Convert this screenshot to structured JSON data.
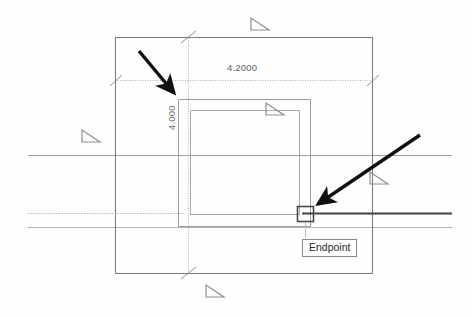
{
  "app": {
    "context": "cad-drawing-viewport",
    "background_color": "#fefefe"
  },
  "dimensions": {
    "horizontal": {
      "label": "4.2000",
      "name": "horizontal-dimension",
      "units": "inches"
    },
    "vertical": {
      "label": "4.000",
      "name": "vertical-dimension",
      "units": "inches"
    }
  },
  "tooltip": {
    "label": "Endpoint",
    "border_color": "#8a8a8a",
    "text_color": "#2b2b2b",
    "background_color": "#fdfdfd"
  },
  "snap_marker": {
    "name": "endpoint-snap-square",
    "type": "square",
    "color": "#4a4a4a"
  },
  "grips": [
    {
      "name": "grip-top",
      "x": 257,
      "y": 23,
      "color": "#8d8d8d"
    },
    {
      "name": "grip-left",
      "x": 88,
      "y": 135,
      "color": "#8d8d8d"
    },
    {
      "name": "grip-inner",
      "x": 272,
      "y": 108,
      "color": "#8d8d8d"
    },
    {
      "name": "grip-right",
      "x": 376,
      "y": 177,
      "color": "#8d8d8d"
    },
    {
      "name": "grip-bottom",
      "x": 212,
      "y": 290,
      "color": "#8d8d8d"
    }
  ],
  "annotations": [
    {
      "name": "annotation-arrow-upper-left",
      "points_to": "rectangle-corner",
      "color": "#111111"
    },
    {
      "name": "annotation-arrow-lower-right",
      "points_to": "endpoint-snap-square",
      "color": "#111111"
    }
  ],
  "geometry": {
    "outer_rectangle": {
      "name": "outer-rectangle",
      "color": "#7f7f7f"
    },
    "inner_rectangle_a": {
      "name": "inner-rectangle-outer",
      "color": "#9a9a9a"
    },
    "inner_rectangle_b": {
      "name": "inner-rectangle-inner",
      "color": "#a8a8a8"
    },
    "construction_lines": {
      "name": "construction-lines",
      "color": "#a5a5a5"
    },
    "highlight_line": {
      "name": "highlighted-edge",
      "color": "#3a3a3a"
    }
  }
}
